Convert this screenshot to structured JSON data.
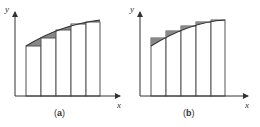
{
  "panels": [
    {
      "id": "a",
      "caption_open": "(",
      "caption_letter": "a",
      "caption_close": ")",
      "x_label": "x",
      "y_label": "y",
      "approximation": "lower"
    },
    {
      "id": "b",
      "caption_open": "(",
      "caption_letter": "b",
      "caption_close": ")",
      "x_label": "x",
      "y_label": "y",
      "approximation": "upper"
    }
  ],
  "colors": {
    "axis": "#333333",
    "bar_stroke": "#555555",
    "shade": "#888888",
    "curve": "#333333"
  }
}
